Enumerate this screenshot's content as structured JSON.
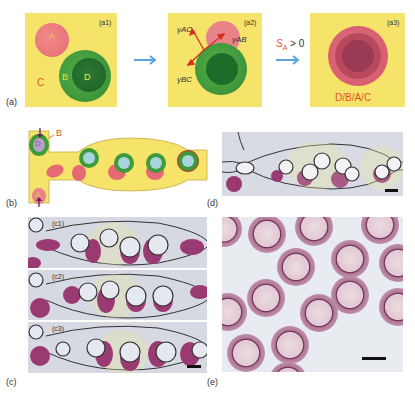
{
  "figure": {
    "panels": {
      "a": {
        "label": "(a)",
        "a1": {
          "label": "(a1)",
          "phase_A": "A",
          "phase_B": "B",
          "phase_C": "C",
          "phase_D": "D"
        },
        "a2": {
          "label": "(a2)",
          "gamma_AC": "γAC",
          "gamma_AB": "γAB",
          "gamma_BC": "γBC"
        },
        "a3": {
          "label": "(a3)",
          "config": "D/B/A/C"
        },
        "condition": "S",
        "condition_sub": "A",
        "condition_rest": " > 0"
      },
      "b": {
        "label": "(b)",
        "inlet_B": "B",
        "inlet_D": "D",
        "inlet_A": "A"
      },
      "c": {
        "label": "(c)",
        "c1": "(c1)",
        "c2": "(c2)",
        "c3": "(c3)"
      },
      "d": {
        "label": "(d)"
      },
      "e": {
        "label": "(e)"
      }
    },
    "colors": {
      "yellow": "#f6e36a",
      "phase_A": "#e9727a",
      "phase_B": "#3f9a3a",
      "phase_D": "#1f6b2a",
      "inner_blue": "#a8d4e0",
      "arrow_blue": "#5aa6dc",
      "label_orange": "#e0551f",
      "droplet_magenta": "#9a3a72"
    }
  }
}
